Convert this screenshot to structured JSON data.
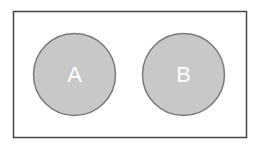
{
  "diagram": {
    "type": "venn",
    "universe": {
      "x": 13,
      "y": 11,
      "width": 233,
      "height": 126,
      "stroke": "#444444",
      "fill": "#ffffff"
    },
    "sets": [
      {
        "label": "A",
        "cx": 74.5,
        "cy": 74.5,
        "r": 41,
        "fill": "#c8c8c8",
        "stroke": "#7a7a7a",
        "text_color": "#ffffff"
      },
      {
        "label": "B",
        "cx": 183.5,
        "cy": 74.5,
        "r": 41,
        "fill": "#c8c8c8",
        "stroke": "#7a7a7a",
        "text_color": "#ffffff"
      }
    ],
    "overlap": false
  }
}
